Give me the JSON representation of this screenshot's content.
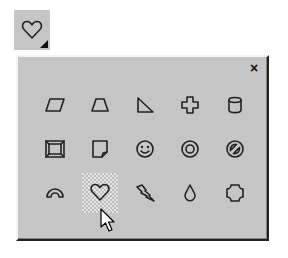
{
  "toolbar": {
    "button": {
      "icon": "heart-icon",
      "has_dropdown": true,
      "tooltip": ""
    }
  },
  "palette": {
    "close_label": "×",
    "selected_index": 11,
    "shapes": [
      {
        "name": "parallelogram",
        "icon": "parallelogram-icon"
      },
      {
        "name": "trapezoid",
        "icon": "trapezoid-icon"
      },
      {
        "name": "right-triangle",
        "icon": "right-triangle-icon"
      },
      {
        "name": "cross",
        "icon": "cross-icon"
      },
      {
        "name": "can",
        "icon": "can-icon"
      },
      {
        "name": "bevel",
        "icon": "bevel-icon"
      },
      {
        "name": "folded-corner",
        "icon": "folded-corner-icon"
      },
      {
        "name": "smiley-face",
        "icon": "smiley-icon"
      },
      {
        "name": "donut",
        "icon": "donut-icon"
      },
      {
        "name": "no-symbol",
        "icon": "no-symbol-icon"
      },
      {
        "name": "block-arc",
        "icon": "block-arc-icon"
      },
      {
        "name": "heart",
        "icon": "heart-icon"
      },
      {
        "name": "lightning-bolt",
        "icon": "lightning-bolt-icon"
      },
      {
        "name": "teardrop",
        "icon": "teardrop-icon"
      },
      {
        "name": "plaque",
        "icon": "plaque-icon"
      }
    ]
  },
  "colors": {
    "panel_face": "#c0c0c0",
    "icon_stroke": "#222222",
    "highlight": "#f4f4f4",
    "shadow": "#222222"
  }
}
